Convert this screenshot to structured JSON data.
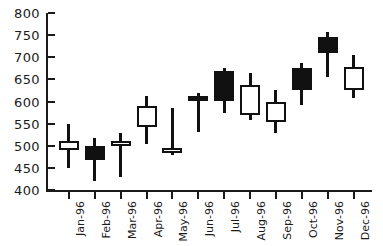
{
  "chart_data": {
    "type": "bar",
    "subtype": "candlestick-ohlc",
    "title": "",
    "xlabel": "",
    "ylabel": "",
    "grid": false,
    "legend": false,
    "ylim": [
      400,
      800
    ],
    "ytick_step": 50,
    "ytick_labels": [
      "800",
      "750",
      "700",
      "650",
      "600",
      "550",
      "500",
      "450",
      "400"
    ],
    "ytick_values": [
      800,
      750,
      700,
      650,
      600,
      550,
      500,
      450,
      400
    ],
    "categories": [
      "Jan-96",
      "Feb-96",
      "Mar-96",
      "Apr-96",
      "May-96",
      "Jun-96",
      "Jul-96",
      "Aug-96",
      "Sep-96",
      "Oct-96",
      "Nov-96",
      "Dec-96"
    ],
    "colors": {
      "up_fill": "#ffffff",
      "down_fill": "#111111",
      "outline": "#111111",
      "axis": "#1a1a1a"
    },
    "series": [
      {
        "name": "Open",
        "values": [
          510,
          500,
          510,
          543,
          494,
          612,
          670,
          570,
          553,
          625,
          745,
          625
        ]
      },
      {
        "name": "High",
        "values": [
          550,
          518,
          528,
          613,
          585,
          620,
          675,
          665,
          625,
          688,
          758,
          705
        ]
      },
      {
        "name": "Low",
        "values": [
          450,
          420,
          430,
          503,
          478,
          530,
          573,
          558,
          528,
          593,
          655,
          608
        ]
      },
      {
        "name": "Close",
        "values": [
          490,
          468,
          503,
          590,
          488,
          603,
          602,
          638,
          600,
          675,
          710,
          678
        ]
      }
    ],
    "points": [
      {
        "label": "Jan-96",
        "open": 510,
        "high": 550,
        "low": 450,
        "close": 490,
        "direction": "down_body_hollow",
        "filled": false
      },
      {
        "label": "Feb-96",
        "open": 500,
        "high": 518,
        "low": 420,
        "close": 468,
        "direction": "down",
        "filled": true
      },
      {
        "label": "Mar-96",
        "open": 503,
        "high": 528,
        "low": 430,
        "close": 510,
        "direction": "up",
        "filled": false
      },
      {
        "label": "Apr-96",
        "open": 543,
        "high": 613,
        "low": 503,
        "close": 590,
        "direction": "up",
        "filled": false
      },
      {
        "label": "May-96",
        "open": 488,
        "high": 585,
        "low": 478,
        "close": 494,
        "direction": "up",
        "filled": false
      },
      {
        "label": "Jun-96",
        "open": 612,
        "high": 620,
        "low": 530,
        "close": 603,
        "direction": "down",
        "filled": true
      },
      {
        "label": "Jul-96",
        "open": 670,
        "high": 675,
        "low": 573,
        "close": 602,
        "direction": "down",
        "filled": true
      },
      {
        "label": "Aug-96",
        "open": 570,
        "high": 665,
        "low": 558,
        "close": 638,
        "direction": "up",
        "filled": false
      },
      {
        "label": "Sep-96",
        "open": 553,
        "high": 625,
        "low": 528,
        "close": 600,
        "direction": "up",
        "filled": false
      },
      {
        "label": "Oct-96",
        "open": 675,
        "high": 688,
        "low": 593,
        "close": 625,
        "direction": "down",
        "filled": true
      },
      {
        "label": "Nov-96",
        "open": 745,
        "high": 758,
        "low": 655,
        "close": 710,
        "direction": "down",
        "filled": true
      },
      {
        "label": "Dec-96",
        "open": 625,
        "high": 705,
        "low": 608,
        "close": 678,
        "direction": "up",
        "filled": false
      }
    ]
  }
}
